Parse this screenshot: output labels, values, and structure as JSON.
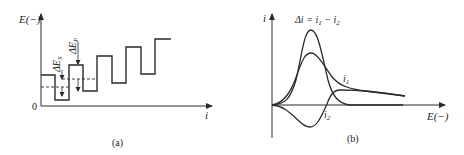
{
  "panel_a": {
    "y_label": "E(−)",
    "x_label": "i",
    "origin_label": "0",
    "delta_es_label": "ΔE",
    "delta_es_sub": "S",
    "delta_ep_label": "ΔE",
    "delta_ep_sub": "P",
    "caption": "(a)",
    "staircase_points": "41,75 55,75 55,100 69,100 69,65 83,65 83,91 97,91 97,56 112,56 112,83 126,83 126,47 141,47 141,74 155,74 155,39 171,39"
  },
  "panel_b": {
    "y_label": "i",
    "x_label": "E(−)",
    "delta_i_label": "Δi = i",
    "delta_i_sub1": "1",
    "delta_i_mid": " − i",
    "delta_i_sub2": "2",
    "i1_label": "i",
    "i1_sub": "1",
    "i2_label": "i",
    "i2_sub": "2",
    "caption": "(b)"
  },
  "colors": {
    "line": "#2a2a2a",
    "text": "#222222"
  }
}
